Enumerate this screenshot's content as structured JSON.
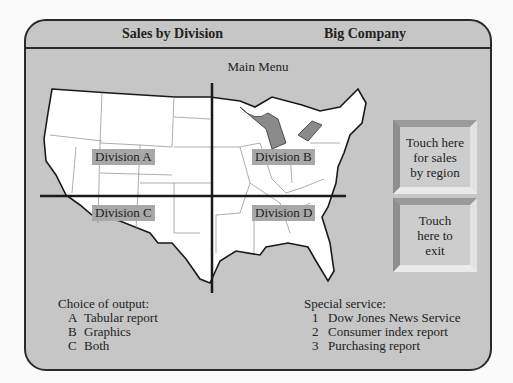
{
  "header": {
    "left_title": "Sales by Division",
    "right_title": "Big Company"
  },
  "main": {
    "menu_title": "Main Menu",
    "map": {
      "divisions": [
        {
          "label": "Division A"
        },
        {
          "label": "Division B"
        },
        {
          "label": "Division C"
        },
        {
          "label": "Division D"
        }
      ]
    },
    "buttons": [
      {
        "label": "Touch here\nfor sales\nby region"
      },
      {
        "label": "Touch\nhere to\nexit"
      }
    ]
  },
  "output_choices": {
    "title": "Choice of output:",
    "items": [
      {
        "key": "A",
        "label": "Tabular report"
      },
      {
        "key": "B",
        "label": "Graphics"
      },
      {
        "key": "C",
        "label": "Both"
      }
    ]
  },
  "special_service": {
    "title": "Special service:",
    "items": [
      {
        "key": "1",
        "label": "Dow Jones News Service"
      },
      {
        "key": "2",
        "label": "Consumer index report"
      },
      {
        "key": "3",
        "label": "Purchasing report"
      }
    ]
  }
}
